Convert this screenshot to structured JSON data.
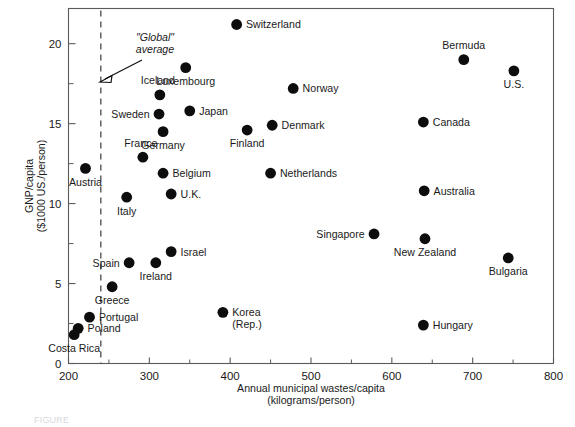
{
  "chart_data": {
    "type": "scatter",
    "title": "",
    "xlabel": "Annual municipal wastes/capita (kilograms/person)",
    "xlabel_line1": "Annual municipal wastes/capita",
    "xlabel_line2": "(kilograms/person)",
    "ylabel": "GNP/capita ($1000 US./person)",
    "ylabel_line1": "GNP/capita",
    "ylabel_line2": "($1000 US./person)",
    "xlim": [
      200,
      800
    ],
    "ylim": [
      0,
      22.2
    ],
    "xticks": [
      200,
      300,
      400,
      500,
      600,
      700,
      800
    ],
    "xticks_minor": [
      250,
      350,
      450,
      550,
      650,
      750
    ],
    "yticks": [
      0,
      5,
      10,
      15,
      20
    ],
    "yticks_minor": [
      2.5,
      7.5,
      12.5,
      17.5
    ],
    "grid": false,
    "legend": "none",
    "marker_color": "#0d0d0d",
    "annotations": [
      {
        "name": "global-average",
        "text_line1": "\"Global\"",
        "text_line2": "average",
        "style": "italic",
        "points_to_x": 240,
        "points_to_y": 17.4
      }
    ],
    "reference_lines": [
      {
        "name": "global-average-line",
        "orientation": "vertical",
        "x": 240,
        "style": "dashed"
      }
    ],
    "points": [
      {
        "label": "Switzerland",
        "x": 408,
        "y": 21.2,
        "label_pos": "right"
      },
      {
        "label": "Bermuda",
        "x": 689,
        "y": 19.0,
        "label_pos": "above"
      },
      {
        "label": "U.S.",
        "x": 751,
        "y": 18.3,
        "label_pos": "below"
      },
      {
        "label": "Luxembourg",
        "x": 345,
        "y": 18.5,
        "label_pos": "below"
      },
      {
        "label": "Norway",
        "x": 478,
        "y": 17.2,
        "label_pos": "right"
      },
      {
        "label": "Iceland",
        "x": 313,
        "y": 16.8,
        "label_pos": "above-left"
      },
      {
        "label": "Japan",
        "x": 350,
        "y": 15.8,
        "label_pos": "right"
      },
      {
        "label": "Sweden",
        "x": 312,
        "y": 15.6,
        "label_pos": "left"
      },
      {
        "label": "Canada",
        "x": 639,
        "y": 15.1,
        "label_pos": "right"
      },
      {
        "label": "Denmark",
        "x": 452,
        "y": 14.9,
        "label_pos": "right"
      },
      {
        "label": "Finland",
        "x": 421,
        "y": 14.6,
        "label_pos": "below"
      },
      {
        "label": "Germany",
        "x": 317,
        "y": 14.5,
        "label_pos": "below"
      },
      {
        "label": "France",
        "x": 292,
        "y": 12.9,
        "label_pos": "above-left"
      },
      {
        "label": "Austria",
        "x": 221,
        "y": 12.2,
        "label_pos": "below"
      },
      {
        "label": "Belgium",
        "x": 317,
        "y": 11.9,
        "label_pos": "right"
      },
      {
        "label": "Netherlands",
        "x": 450,
        "y": 11.9,
        "label_pos": "right"
      },
      {
        "label": "Australia",
        "x": 640,
        "y": 10.8,
        "label_pos": "right"
      },
      {
        "label": "U.K.",
        "x": 327,
        "y": 10.6,
        "label_pos": "right"
      },
      {
        "label": "Italy",
        "x": 272,
        "y": 10.4,
        "label_pos": "below"
      },
      {
        "label": "Singapore",
        "x": 578,
        "y": 8.1,
        "label_pos": "left"
      },
      {
        "label": "New Zealand",
        "x": 641,
        "y": 7.8,
        "label_pos": "below"
      },
      {
        "label": "Israel",
        "x": 327,
        "y": 7.0,
        "label_pos": "right"
      },
      {
        "label": "Bulgaria",
        "x": 744,
        "y": 6.6,
        "label_pos": "below"
      },
      {
        "label": "Spain",
        "x": 275,
        "y": 6.3,
        "label_pos": "left"
      },
      {
        "label": "Ireland",
        "x": 308,
        "y": 6.3,
        "label_pos": "below"
      },
      {
        "label": "Greece",
        "x": 254,
        "y": 4.8,
        "label_pos": "below"
      },
      {
        "label": "Korea (Rep.)",
        "x": 391,
        "y": 3.2,
        "label_pos": "right",
        "label_line1": "Korea",
        "label_line2": "(Rep.)"
      },
      {
        "label": "Portugal",
        "x": 226,
        "y": 2.9,
        "label_pos": "right"
      },
      {
        "label": "Hungary",
        "x": 639,
        "y": 2.4,
        "label_pos": "right"
      },
      {
        "label": "Poland",
        "x": 212,
        "y": 2.2,
        "label_pos": "right"
      },
      {
        "label": "Costa Rica",
        "x": 207,
        "y": 1.8,
        "label_pos": "below"
      }
    ]
  },
  "caption": {
    "text": "FIGURE"
  }
}
